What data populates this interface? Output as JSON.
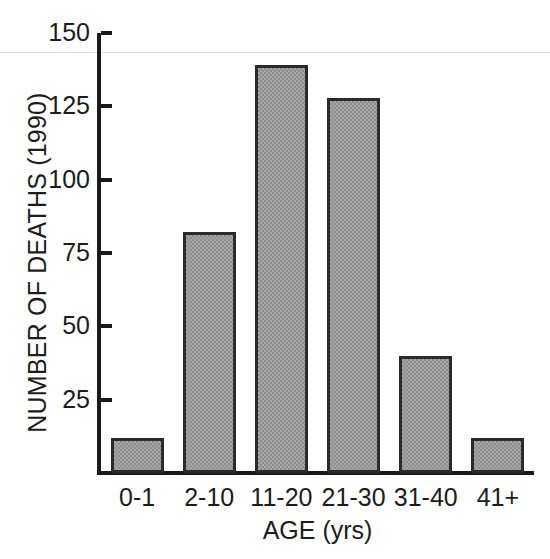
{
  "chart_data": {
    "type": "bar",
    "title": "",
    "subtitle": "",
    "xlabel": "AGE (yrs)",
    "ylabel": "NUMBER OF DEATHS (1990)",
    "categories": [
      "0-1",
      "2-10",
      "11-20",
      "21-30",
      "31-40",
      "41+"
    ],
    "values": [
      12,
      82,
      139,
      128,
      40,
      12
    ],
    "series": [
      {
        "name": "Number of deaths (1990)",
        "values": [
          12,
          82,
          139,
          128,
          40,
          12
        ]
      }
    ],
    "ylim": [
      0,
      150
    ],
    "yticks": [
      25,
      50,
      75,
      100,
      125,
      150
    ],
    "ytick_labels": [
      "25",
      "50",
      "75",
      "100",
      "125",
      "150"
    ],
    "xlim_categories": 6,
    "grid": false,
    "legend": null,
    "legend_position": "none",
    "annotations": [],
    "bar_fill_color": "#a6a6a6",
    "bar_edge_color": "#2a2a2a",
    "axis_color": "#191919",
    "background_color": "#ffffff"
  }
}
